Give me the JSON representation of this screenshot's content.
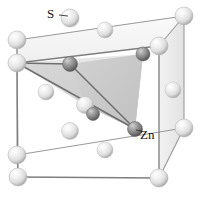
{
  "figure": {
    "name": "zinc-blende-unit-cell",
    "title": "",
    "background_color": "#ffffff",
    "width": 203,
    "height": 197
  },
  "labels": {
    "sulfur": "S",
    "zinc": "Zn"
  },
  "colors": {
    "sulfur_sphere_light": "#f4f4f4",
    "sulfur_sphere_mid": "#d8d8d8",
    "sulfur_sphere_dark": "#a9a9a9",
    "zinc_sphere_light": "#b8b8b8",
    "zinc_sphere_mid": "#8f8f8f",
    "zinc_sphere_dark": "#5a5a5a",
    "cell_edge": "#8a8a8a",
    "tetrahedron_face_light": "#e4e4e4",
    "tetrahedron_face_mid": "#cfcfcf",
    "tetrahedron_face_dark": "#b4b4b4",
    "label_text": "#111111",
    "bond_line": "#6f6f6f"
  },
  "cell": {
    "type": "cubic-unit-cell",
    "vertices": {
      "back_top_left": [
        17,
        40
      ],
      "back_top_right": [
        184,
        16
      ],
      "front_top_left": [
        17,
        63
      ],
      "front_top_right": [
        159,
        46
      ],
      "back_bottom_left": [
        17,
        155
      ],
      "back_bottom_right": [
        184,
        128
      ],
      "front_bottom_left": [
        18,
        177
      ],
      "front_bottom_right": [
        159,
        178
      ]
    }
  },
  "atoms": {
    "sulfur": {
      "element": "S",
      "role": "fcc-lattice-sites",
      "radius_px": 9,
      "positions": [
        [
          17,
          40
        ],
        [
          184,
          16
        ],
        [
          17,
          63
        ],
        [
          159,
          46
        ],
        [
          17,
          155
        ],
        [
          184,
          128
        ],
        [
          18,
          177
        ],
        [
          159,
          178
        ],
        [
          70,
          18
        ],
        [
          105,
          30
        ],
        [
          46,
          92
        ],
        [
          173,
          90
        ],
        [
          85,
          105
        ],
        [
          105,
          150
        ],
        [
          70,
          131
        ]
      ]
    },
    "zinc": {
      "element": "Zn",
      "role": "tetrahedral-interstitial-sites",
      "radius_px": 7,
      "positions": [
        [
          70,
          64
        ],
        [
          143,
          54
        ],
        [
          135,
          129
        ],
        [
          93,
          114
        ]
      ]
    }
  },
  "tetrahedron": {
    "description": "shaded tetrahedron showing Zn coordinated by four S",
    "apex": [
      70,
      64
    ],
    "faces": [
      {
        "name": "left-face",
        "fill": "#e4e4e4"
      },
      {
        "name": "right-face",
        "fill": "#cfcfcf"
      },
      {
        "name": "bottom-face",
        "fill": "#dcdcdc"
      }
    ]
  },
  "leader_lines": {
    "sulfur": {
      "from": [
        60,
        18
      ],
      "to": [
        70,
        18
      ]
    },
    "zinc": {
      "from": [
        140,
        132
      ],
      "to": [
        135,
        129
      ]
    }
  }
}
